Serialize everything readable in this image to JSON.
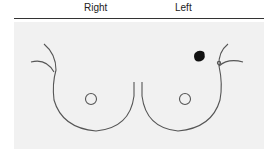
{
  "header": {
    "right_label": "Right",
    "left_label": "Left"
  },
  "diagram": {
    "marker": {
      "side": "left",
      "location": "upper outer quadrant",
      "color": "#111111"
    },
    "line_color": "#555555"
  }
}
